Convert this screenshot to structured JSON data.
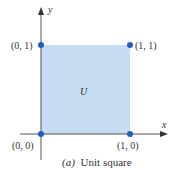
{
  "figure": {
    "caption_prefix": "(a)",
    "caption_text": "Unit square",
    "region_label": "U",
    "axes": {
      "x_label": "x",
      "y_label": "y"
    },
    "points": [
      {
        "label": "(0, 0)",
        "x": 0,
        "y": 0
      },
      {
        "label": "(1, 0)",
        "x": 1,
        "y": 0
      },
      {
        "label": "(0, 1)",
        "x": 0,
        "y": 1
      },
      {
        "label": "(1, 1)",
        "x": 1,
        "y": 1
      }
    ],
    "colors": {
      "fill": "#c6dcf3",
      "point": "#1f5fbf",
      "axis": "#444444"
    }
  }
}
